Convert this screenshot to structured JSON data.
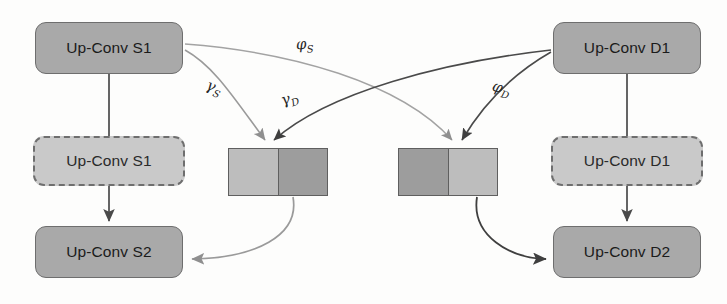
{
  "diagram": {
    "colors": {
      "node_fill": "#a9a9a9",
      "node_border": "#6e6e6e",
      "ghost_fill": "#c9c9c9",
      "feature_light": "#bdbdbd",
      "feature_dark": "#9d9d9d",
      "edge_source": "#9a9a9a",
      "edge_domain": "#4a4a4a",
      "background": "#fdfdfc"
    },
    "nodes": [
      {
        "id": "s1",
        "label": "Up-Conv S1",
        "style": "solid",
        "column": "left"
      },
      {
        "id": "s1_ghost",
        "label": "Up-Conv S1",
        "style": "dashed",
        "column": "left"
      },
      {
        "id": "s2",
        "label": "Up-Conv S2",
        "style": "solid",
        "column": "left"
      },
      {
        "id": "d1",
        "label": "Up-Conv D1",
        "style": "solid",
        "column": "right"
      },
      {
        "id": "d1_ghost",
        "label": "Up-Conv D1",
        "style": "dashed",
        "column": "right"
      },
      {
        "id": "d2",
        "label": "Up-Conv D2",
        "style": "solid",
        "column": "right"
      }
    ],
    "feature_blocks": [
      {
        "id": "feat_left",
        "halves": [
          "light",
          "dark"
        ]
      },
      {
        "id": "feat_right",
        "halves": [
          "dark",
          "light"
        ]
      }
    ],
    "edge_labels": [
      {
        "id": "phi_s",
        "symbol": "φ",
        "subscript": "S",
        "from": "s1",
        "to": "feat_right",
        "tone": "light"
      },
      {
        "id": "gamma_s",
        "symbol": "γ",
        "subscript": "S",
        "from": "s1",
        "to": "feat_left",
        "tone": "light"
      },
      {
        "id": "gamma_d",
        "symbol": "γ",
        "subscript": "D",
        "from": "d1",
        "to": "feat_left",
        "tone": "dark"
      },
      {
        "id": "phi_d",
        "symbol": "φ",
        "subscript": "D",
        "from": "d1",
        "to": "feat_right",
        "tone": "dark"
      }
    ],
    "plain_edges": [
      {
        "id": "s1_to_s2",
        "from": "s1",
        "to": "s2",
        "kind": "vertical",
        "tone": "dark"
      },
      {
        "id": "d1_to_d2",
        "from": "d1",
        "to": "d2",
        "kind": "vertical",
        "tone": "dark"
      },
      {
        "id": "featl_to_s2",
        "from": "feat_left",
        "to": "s2",
        "kind": "curve",
        "tone": "light"
      },
      {
        "id": "featr_to_d2",
        "from": "feat_right",
        "to": "d2",
        "kind": "curve",
        "tone": "dark"
      }
    ]
  }
}
